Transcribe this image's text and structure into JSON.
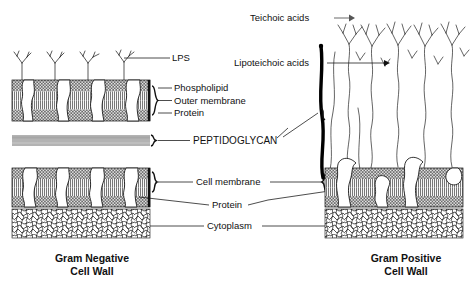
{
  "figure": {
    "background_color": "#ffffff",
    "ink_color": "#111111",
    "peptidoglycan_band_color": "#b3b3b3",
    "leader_gray": "#777777"
  },
  "labels": {
    "lps": "LPS",
    "phospholipid": "Phospholipid",
    "outer_membrane": "Outer membrane",
    "protein_top": "Protein",
    "peptidoglycan": "PEPTIDOGLYCAN",
    "cell_membrane": "Cell membrane",
    "protein_bottom": "Protein",
    "cytoplasm": "Cytoplasm",
    "teichoic_acids": "Teichoic acids",
    "lipoteichoic_acids": "Lipoteichoic acids"
  },
  "captions": {
    "left_line1": "Gram Negative",
    "left_line2": "Cell Wall",
    "right_line1": "Gram Positive",
    "right_line2": "Cell Wall"
  },
  "panels": {
    "left": {
      "name": "gram-negative-cell-wall",
      "layers": [
        "lipopolysaccharide",
        "outer-membrane",
        "peptidoglycan",
        "cell-membrane",
        "cytoplasm"
      ],
      "lps_count": 4,
      "outer_membrane_protein_count": 4,
      "cell_membrane_protein_count": 4,
      "peptidoglycan_thickness": "thin"
    },
    "right": {
      "name": "gram-positive-cell-wall",
      "layers": [
        "teichoic-acids",
        "lipoteichoic-acids",
        "peptidoglycan",
        "cell-membrane",
        "cytoplasm"
      ],
      "teichoic_chain_count": 5,
      "cell_membrane_protein_count": 4,
      "peptidoglycan_thickness": "thick"
    }
  }
}
